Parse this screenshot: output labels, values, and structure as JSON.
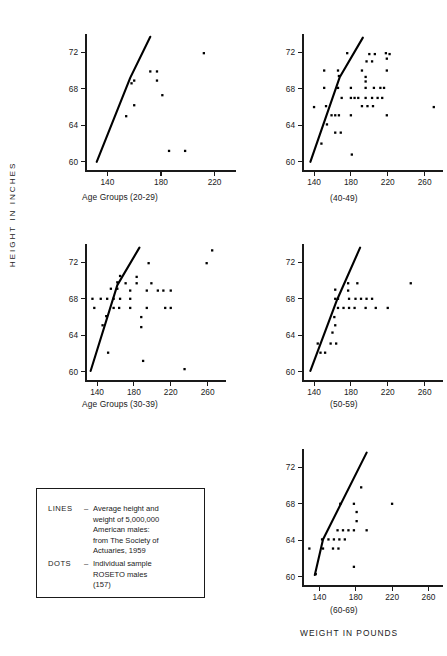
{
  "figure": {
    "y_axis_label": "HEIGHT IN INCHES",
    "x_axis_label": "WEIGHT IN POUNDS"
  },
  "legend": {
    "lines": {
      "key": "LINES",
      "dash": "–",
      "text": [
        "Average height and",
        "weight of 5,000,000",
        "American males:",
        "from The Society of",
        "Actuaries, 1959"
      ]
    },
    "dots": {
      "key": "DOTS",
      "dash": "–",
      "text": [
        "Individual sample",
        "ROSETO males",
        "(157)"
      ]
    }
  },
  "chart_data": [
    {
      "id": "panel-20-29",
      "type": "scatter",
      "title": "Age Groups (20-29)",
      "xlabel": "WEIGHT IN POUNDS",
      "ylabel": "HEIGHT IN INCHES",
      "xlim": [
        124,
        236
      ],
      "ylim": [
        59,
        74
      ],
      "xticks": [
        140,
        180,
        220
      ],
      "yticks": [
        60,
        64,
        68,
        72
      ],
      "grid": false,
      "points": [
        {
          "x": 212,
          "y": 71.9
        },
        {
          "x": 172,
          "y": 69.9
        },
        {
          "x": 177,
          "y": 69.9
        },
        {
          "x": 160,
          "y": 68.9
        },
        {
          "x": 177,
          "y": 68.9
        },
        {
          "x": 158,
          "y": 68.6
        },
        {
          "x": 181,
          "y": 67.3
        },
        {
          "x": 160,
          "y": 66.2
        },
        {
          "x": 154,
          "y": 65.0
        },
        {
          "x": 186,
          "y": 61.2
        },
        {
          "x": 198,
          "y": 61.2
        }
      ],
      "line": [
        {
          "x": 132,
          "y": 60.0
        },
        {
          "x": 157,
          "y": 69.2
        },
        {
          "x": 172,
          "y": 73.7
        }
      ]
    },
    {
      "id": "panel-40-49",
      "type": "scatter",
      "title": "(40-49)",
      "xlabel": "WEIGHT IN POUNDS",
      "ylabel": "HEIGHT IN INCHES",
      "xlim": [
        128,
        280
      ],
      "ylim": [
        59,
        74
      ],
      "xticks": [
        140,
        180,
        220,
        260
      ],
      "yticks": [
        60,
        64,
        68,
        72
      ],
      "grid": false,
      "points": [
        {
          "x": 176,
          "y": 71.9
        },
        {
          "x": 200,
          "y": 71.8
        },
        {
          "x": 206,
          "y": 71.8
        },
        {
          "x": 218,
          "y": 71.9
        },
        {
          "x": 222,
          "y": 71.8
        },
        {
          "x": 219,
          "y": 71.3
        },
        {
          "x": 197,
          "y": 71.0
        },
        {
          "x": 203,
          "y": 71.0
        },
        {
          "x": 151,
          "y": 70.0
        },
        {
          "x": 166,
          "y": 70.0
        },
        {
          "x": 192,
          "y": 70.0
        },
        {
          "x": 219,
          "y": 70.0
        },
        {
          "x": 167,
          "y": 69.4
        },
        {
          "x": 196,
          "y": 69.3
        },
        {
          "x": 196,
          "y": 68.8
        },
        {
          "x": 151,
          "y": 68.1
        },
        {
          "x": 166,
          "y": 68.1
        },
        {
          "x": 180,
          "y": 68.1
        },
        {
          "x": 196,
          "y": 68.1
        },
        {
          "x": 205,
          "y": 68.1
        },
        {
          "x": 212,
          "y": 68.1
        },
        {
          "x": 216,
          "y": 68.1
        },
        {
          "x": 140,
          "y": 66.0
        },
        {
          "x": 153,
          "y": 66.1
        },
        {
          "x": 170,
          "y": 67.0
        },
        {
          "x": 180,
          "y": 67.0
        },
        {
          "x": 184,
          "y": 67.0
        },
        {
          "x": 188,
          "y": 67.0
        },
        {
          "x": 196,
          "y": 67.0
        },
        {
          "x": 203,
          "y": 67.0
        },
        {
          "x": 209,
          "y": 67.0
        },
        {
          "x": 214,
          "y": 67.0
        },
        {
          "x": 192,
          "y": 66.1
        },
        {
          "x": 198,
          "y": 66.1
        },
        {
          "x": 204,
          "y": 66.1
        },
        {
          "x": 270,
          "y": 66.0
        },
        {
          "x": 159,
          "y": 65.1
        },
        {
          "x": 163,
          "y": 65.1
        },
        {
          "x": 167,
          "y": 65.1
        },
        {
          "x": 180,
          "y": 65.1
        },
        {
          "x": 219,
          "y": 65.1
        },
        {
          "x": 154,
          "y": 64.1
        },
        {
          "x": 163,
          "y": 63.2
        },
        {
          "x": 169,
          "y": 63.2
        },
        {
          "x": 148,
          "y": 62.0
        },
        {
          "x": 181,
          "y": 60.8
        }
      ],
      "line": [
        {
          "x": 136,
          "y": 60.0
        },
        {
          "x": 168,
          "y": 69.3
        },
        {
          "x": 193,
          "y": 73.6
        }
      ]
    },
    {
      "id": "panel-30-39",
      "type": "scatter",
      "title": "Age Groups (30-39)",
      "xlabel": "WEIGHT IN POUNDS",
      "ylabel": "HEIGHT IN INCHES",
      "xlim": [
        128,
        280
      ],
      "ylim": [
        59,
        74
      ],
      "xticks": [
        140,
        180,
        220,
        260
      ],
      "yticks": [
        60,
        64,
        68,
        72
      ],
      "grid": false,
      "points": [
        {
          "x": 265,
          "y": 73.3
        },
        {
          "x": 196,
          "y": 71.9
        },
        {
          "x": 259,
          "y": 71.9
        },
        {
          "x": 165,
          "y": 70.5
        },
        {
          "x": 183,
          "y": 70.4
        },
        {
          "x": 162,
          "y": 69.8
        },
        {
          "x": 171,
          "y": 69.7
        },
        {
          "x": 183,
          "y": 69.7
        },
        {
          "x": 199,
          "y": 69.7
        },
        {
          "x": 155,
          "y": 69.1
        },
        {
          "x": 162,
          "y": 69.1
        },
        {
          "x": 176,
          "y": 68.9
        },
        {
          "x": 194,
          "y": 68.9
        },
        {
          "x": 206,
          "y": 68.9
        },
        {
          "x": 212,
          "y": 68.9
        },
        {
          "x": 220,
          "y": 68.9
        },
        {
          "x": 135,
          "y": 68.0
        },
        {
          "x": 144,
          "y": 68.0
        },
        {
          "x": 151,
          "y": 68.0
        },
        {
          "x": 158,
          "y": 68.0
        },
        {
          "x": 165,
          "y": 68.0
        },
        {
          "x": 176,
          "y": 68.0
        },
        {
          "x": 137,
          "y": 67.0
        },
        {
          "x": 158,
          "y": 67.0
        },
        {
          "x": 164,
          "y": 67.0
        },
        {
          "x": 176,
          "y": 67.0
        },
        {
          "x": 194,
          "y": 67.0
        },
        {
          "x": 214,
          "y": 67.0
        },
        {
          "x": 220,
          "y": 67.0
        },
        {
          "x": 150,
          "y": 66.1
        },
        {
          "x": 188,
          "y": 66.0
        },
        {
          "x": 146,
          "y": 65.1
        },
        {
          "x": 188,
          "y": 64.9
        },
        {
          "x": 152,
          "y": 62.1
        },
        {
          "x": 190,
          "y": 61.2
        },
        {
          "x": 235,
          "y": 60.3
        }
      ],
      "line": [
        {
          "x": 133,
          "y": 60.1
        },
        {
          "x": 162,
          "y": 69.5
        },
        {
          "x": 186,
          "y": 73.6
        }
      ]
    },
    {
      "id": "panel-50-59",
      "type": "scatter",
      "title": "(50-59)",
      "xlabel": "WEIGHT IN POUNDS",
      "ylabel": "HEIGHT IN INCHES",
      "xlim": [
        128,
        280
      ],
      "ylim": [
        59,
        74
      ],
      "xticks": [
        140,
        180,
        220,
        260
      ],
      "yticks": [
        60,
        64,
        68,
        72
      ],
      "grid": false,
      "points": [
        {
          "x": 177,
          "y": 69.7
        },
        {
          "x": 187,
          "y": 69.7
        },
        {
          "x": 245,
          "y": 69.7
        },
        {
          "x": 163,
          "y": 69.0
        },
        {
          "x": 177,
          "y": 68.9
        },
        {
          "x": 163,
          "y": 68.0
        },
        {
          "x": 166,
          "y": 68.0
        },
        {
          "x": 178,
          "y": 68.0
        },
        {
          "x": 185,
          "y": 68.0
        },
        {
          "x": 191,
          "y": 68.0
        },
        {
          "x": 197,
          "y": 68.0
        },
        {
          "x": 203,
          "y": 68.0
        },
        {
          "x": 166,
          "y": 67.0
        },
        {
          "x": 172,
          "y": 67.0
        },
        {
          "x": 178,
          "y": 67.0
        },
        {
          "x": 184,
          "y": 67.0
        },
        {
          "x": 196,
          "y": 67.0
        },
        {
          "x": 207,
          "y": 67.0
        },
        {
          "x": 220,
          "y": 67.0
        },
        {
          "x": 162,
          "y": 66.0
        },
        {
          "x": 163,
          "y": 65.1
        },
        {
          "x": 160,
          "y": 64.3
        },
        {
          "x": 144,
          "y": 63.1
        },
        {
          "x": 158,
          "y": 63.1
        },
        {
          "x": 164,
          "y": 63.1
        },
        {
          "x": 147,
          "y": 62.1
        },
        {
          "x": 152,
          "y": 62.1
        }
      ],
      "line": [
        {
          "x": 136,
          "y": 60.1
        },
        {
          "x": 165,
          "y": 67.9
        },
        {
          "x": 190,
          "y": 73.6
        }
      ]
    },
    {
      "id": "panel-60-69",
      "type": "scatter",
      "title": "(60-69)",
      "xlabel": "WEIGHT IN POUNDS",
      "ylabel": "HEIGHT IN INCHES",
      "xlim": [
        122,
        276
      ],
      "ylim": [
        59,
        74
      ],
      "xticks": [
        140,
        180,
        220,
        260
      ],
      "yticks": [
        60,
        64,
        68,
        72
      ],
      "grid": false,
      "points": [
        {
          "x": 186,
          "y": 69.8
        },
        {
          "x": 163,
          "y": 68.0
        },
        {
          "x": 178,
          "y": 68.0
        },
        {
          "x": 220,
          "y": 68.0
        },
        {
          "x": 181,
          "y": 67.1
        },
        {
          "x": 181,
          "y": 66.1
        },
        {
          "x": 160,
          "y": 65.1
        },
        {
          "x": 166,
          "y": 65.1
        },
        {
          "x": 172,
          "y": 65.1
        },
        {
          "x": 178,
          "y": 65.1
        },
        {
          "x": 192,
          "y": 65.1
        },
        {
          "x": 143,
          "y": 64.1
        },
        {
          "x": 150,
          "y": 64.1
        },
        {
          "x": 156,
          "y": 64.1
        },
        {
          "x": 162,
          "y": 64.1
        },
        {
          "x": 168,
          "y": 64.1
        },
        {
          "x": 129,
          "y": 63.1
        },
        {
          "x": 144,
          "y": 63.1
        },
        {
          "x": 155,
          "y": 63.1
        },
        {
          "x": 161,
          "y": 63.1
        },
        {
          "x": 178,
          "y": 61.1
        },
        {
          "x": 136,
          "y": 60.3
        }
      ],
      "line": [
        {
          "x": 135,
          "y": 60.2
        },
        {
          "x": 144,
          "y": 64.1
        },
        {
          "x": 192,
          "y": 73.6
        }
      ]
    }
  ]
}
